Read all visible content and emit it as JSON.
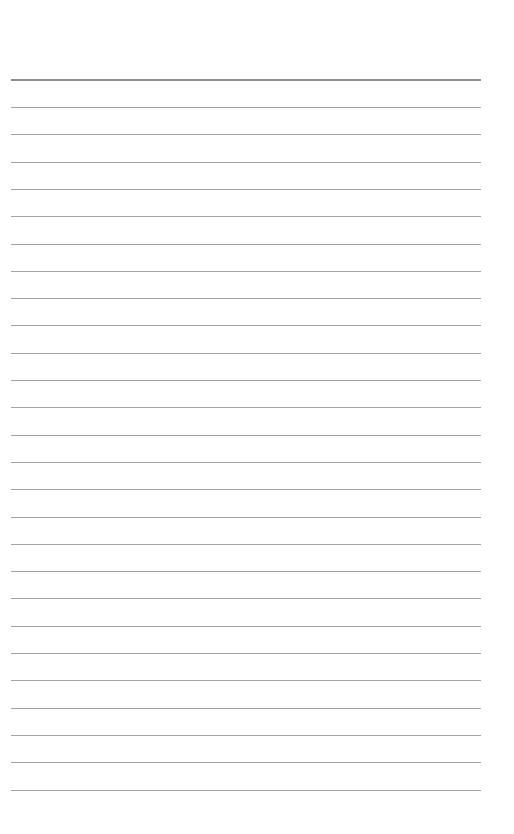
{
  "page": {
    "type": "lined-paper",
    "background_color": "#ffffff",
    "line_color": "#a3a3a3",
    "header_line_color": "#8f8f8f",
    "line_left_px": 11,
    "line_right_px": 481,
    "header_line_y": 79,
    "first_ruled_line_y": 107,
    "line_spacing_px": 27.3,
    "ruled_line_count": 26,
    "text_content": []
  }
}
